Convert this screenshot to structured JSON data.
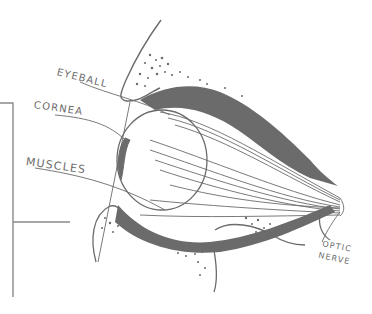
{
  "diagram": {
    "type": "anatomical-sketch",
    "stroke_color": "#6b6b6b",
    "background_color": "#ffffff",
    "labels": {
      "eyeball": "EYEBALL",
      "cornea": "CORNEA",
      "muscles": "MUSCLES",
      "optic": "OPTIC",
      "nerve": "NERVE"
    }
  }
}
